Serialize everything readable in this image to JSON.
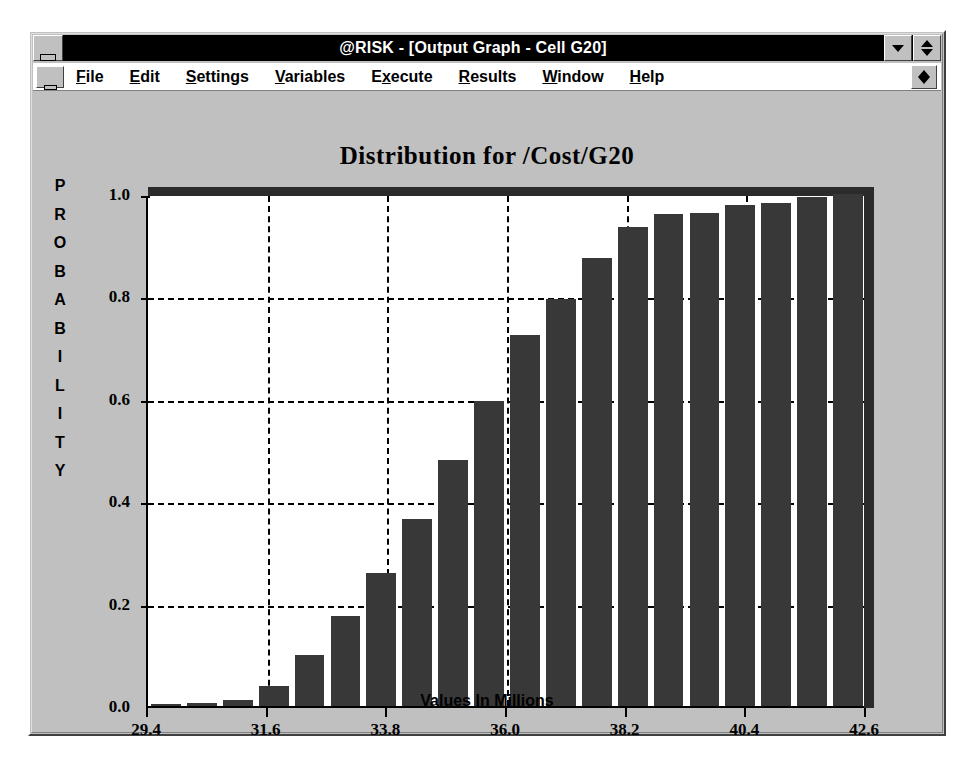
{
  "window": {
    "title": "@RISK - [Output Graph - Cell G20]",
    "system_menu_icon": "window-system-menu-icon",
    "minimize_icon": "minimize-icon",
    "restore_icon": "restore-icon"
  },
  "menu": {
    "document_system_menu_icon": "document-system-menu-icon",
    "document_restore_icon": "document-restore-icon",
    "items": [
      {
        "label": "File",
        "pre": "",
        "key": "F",
        "post": "ile"
      },
      {
        "label": "Edit",
        "pre": "",
        "key": "E",
        "post": "dit"
      },
      {
        "label": "Settings",
        "pre": "",
        "key": "S",
        "post": "ettings"
      },
      {
        "label": "Variables",
        "pre": "",
        "key": "V",
        "post": "ariables"
      },
      {
        "label": "Execute",
        "pre": "E",
        "key": "x",
        "post": "ecute"
      },
      {
        "label": "Results",
        "pre": "",
        "key": "R",
        "post": "esults"
      },
      {
        "label": "Window",
        "pre": "",
        "key": "W",
        "post": "indow"
      },
      {
        "label": "Help",
        "pre": "",
        "key": "H",
        "post": "elp"
      }
    ]
  },
  "chart_data": {
    "type": "bar",
    "title": "Distribution for /Cost/G20",
    "xlabel": "Values In Millions",
    "ylabel": "PROBABILITY",
    "ylabel_letters": [
      "P",
      "R",
      "O",
      "B",
      "A",
      "B",
      "I",
      "L",
      "I",
      "T",
      "Y"
    ],
    "grid": true,
    "legend": null,
    "xlim": [
      29.4,
      42.6
    ],
    "ylim": [
      0.0,
      1.0
    ],
    "xticks": [
      29.4,
      31.6,
      33.8,
      36.0,
      38.2,
      40.4,
      42.6
    ],
    "xtick_labels": [
      "29.4",
      "31.6",
      "33.8",
      "36.0",
      "38.2",
      "40.4",
      "42.6"
    ],
    "yticks": [
      0.0,
      0.2,
      0.4,
      0.6,
      0.8,
      1.0
    ],
    "ytick_labels": [
      "0.0",
      "0.2",
      "0.4",
      "0.6",
      "0.8",
      "1.0"
    ],
    "bar_color": "#383838",
    "plot_bg": "#ffffff",
    "window_bg": "#c0c0c0",
    "n_bars": 20,
    "bin_edges": [
      29.4,
      30.06,
      30.72,
      31.38,
      32.04,
      32.7,
      33.36,
      34.02,
      34.68,
      35.34,
      36.0,
      36.66,
      37.32,
      37.98,
      38.64,
      39.3,
      39.96,
      40.62,
      41.28,
      41.94,
      42.6
    ],
    "categories": [
      "29.73",
      "30.39",
      "31.05",
      "31.71",
      "32.37",
      "33.03",
      "33.69",
      "34.35",
      "35.01",
      "35.67",
      "36.33",
      "36.99",
      "37.65",
      "38.31",
      "38.97",
      "39.63",
      "40.29",
      "40.95",
      "41.61",
      "42.27"
    ],
    "values": [
      0.003,
      0.006,
      0.012,
      0.04,
      0.1,
      0.175,
      0.26,
      0.365,
      0.48,
      0.595,
      0.725,
      0.795,
      0.875,
      0.935,
      0.96,
      0.963,
      0.978,
      0.983,
      0.995,
      1.0
    ]
  }
}
